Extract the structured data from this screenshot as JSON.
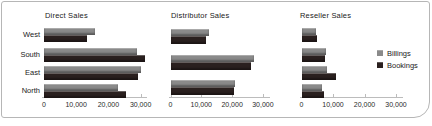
{
  "frame": {
    "border_color": "#b6b6b6",
    "background": "#ffffff"
  },
  "chart_data": {
    "type": "bar",
    "orientation": "horizontal",
    "categories": [
      "West",
      "South",
      "East",
      "North"
    ],
    "x_axis": {
      "ticks": [
        "0",
        "10,000",
        "20,000",
        "30,000"
      ],
      "tick_values": [
        0,
        10000,
        20000,
        30000
      ],
      "range": [
        0,
        31500
      ],
      "grid": false
    },
    "legend": {
      "position": "right",
      "entries": [
        {
          "label": "Billings",
          "color": "#8a8a8a"
        },
        {
          "label": "Bookings",
          "color": "#2a201f"
        }
      ]
    },
    "panels": [
      {
        "title": "Direct Sales",
        "series": [
          {
            "name": "Billings",
            "values": [
              15700,
              29000,
              30000,
              23000
            ]
          },
          {
            "name": "Bookings",
            "values": [
              13400,
              31500,
              29200,
              25500
            ]
          }
        ]
      },
      {
        "title": "Distributor Sales",
        "series": [
          {
            "name": "Billings",
            "values": [
              12500,
              27000,
              21000
            ]
          },
          {
            "name": "Bookings",
            "values": [
              11500,
              26000,
              20500
            ]
          }
        ]
      },
      {
        "title": "Reseller Sales",
        "series": [
          {
            "name": "Billings",
            "values": [
              4700,
              7800,
              8200,
              6600
            ]
          },
          {
            "name": "Bookings",
            "values": [
              5000,
              7600,
              10800,
              7000
            ]
          }
        ]
      }
    ]
  }
}
